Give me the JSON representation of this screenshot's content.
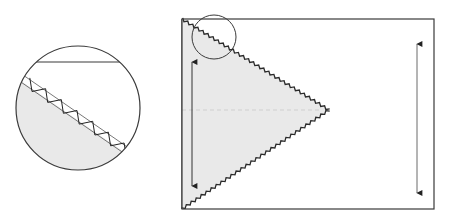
{
  "diagram": {
    "title": "",
    "colors": {
      "stroke": "#3a3a3a",
      "fabric_fill": "#e9e9e9",
      "dashed_line": "#cfcfcf",
      "arrow_right": "#6a6a6a",
      "background": "#ffffff"
    },
    "panel": {
      "x": 182,
      "y": 19,
      "width": 252,
      "height": 190
    },
    "triangle": {
      "points": [
        [
          182,
          19
        ],
        [
          329,
          110
        ],
        [
          182,
          209
        ]
      ],
      "edge_style": "zigzag-stitch"
    },
    "center_fold_line": {
      "x1": 182,
      "y1": 110,
      "x2": 322,
      "y2": 110,
      "style": "dashed"
    },
    "arrows": [
      {
        "name": "left-vertical-arrow",
        "x": 192,
        "y1": 58,
        "y2": 190,
        "heads": "both"
      },
      {
        "name": "right-vertical-arrow",
        "x": 417,
        "y1": 40,
        "y2": 197,
        "heads": "both"
      }
    ],
    "detail_marker_circle": {
      "cx": 214,
      "cy": 37,
      "r": 22
    },
    "magnified_detail": {
      "cx": 78,
      "cy": 108,
      "r": 62,
      "top_edge_line": {
        "y": 62
      },
      "stitch_line": {
        "x1": 27,
        "y1": 82,
        "x2": 137,
        "y2": 158
      }
    }
  }
}
